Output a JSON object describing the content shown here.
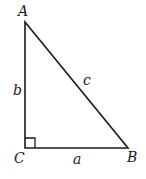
{
  "diagram": {
    "type": "right-triangle",
    "colors": {
      "stroke": "#1a1a1a",
      "background": "#ffffff"
    },
    "vertices": {
      "A": {
        "label": "A",
        "x": 25,
        "y": 22
      },
      "B": {
        "label": "B",
        "x": 128,
        "y": 148
      },
      "C": {
        "label": "C",
        "x": 25,
        "y": 148
      }
    },
    "sides": {
      "a": {
        "label": "a",
        "between": "C-B"
      },
      "b": {
        "label": "b",
        "between": "A-C"
      },
      "c": {
        "label": "c",
        "between": "A-B"
      }
    },
    "right_angle_at": "C"
  }
}
